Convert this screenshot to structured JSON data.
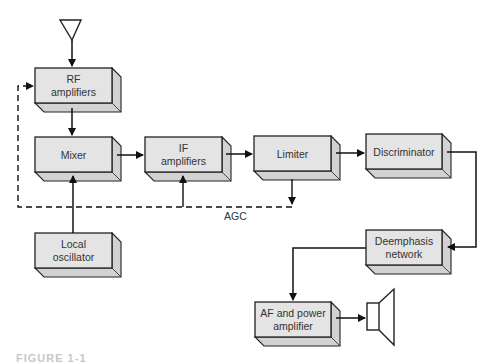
{
  "diagram": {
    "type": "block-diagram",
    "colors": {
      "box_face": "#e4e4e4",
      "box_side": "#d2d2d2",
      "stroke": "#222222",
      "text": "#333333"
    },
    "blocks": [
      {
        "id": "rf",
        "lines": [
          "RF",
          "amplifiers"
        ],
        "x": 35,
        "y": 68,
        "w": 77,
        "h": 35
      },
      {
        "id": "mixer",
        "lines": [
          "Mixer"
        ],
        "x": 35,
        "y": 137,
        "w": 77,
        "h": 35
      },
      {
        "id": "if",
        "lines": [
          "IF",
          "amplifiers"
        ],
        "x": 145,
        "y": 137,
        "w": 77,
        "h": 35
      },
      {
        "id": "lim",
        "lines": [
          "Limiter"
        ],
        "x": 254,
        "y": 136,
        "w": 77,
        "h": 35
      },
      {
        "id": "disc",
        "lines": [
          "Discriminator"
        ],
        "x": 366,
        "y": 134,
        "w": 76,
        "h": 35
      },
      {
        "id": "lo",
        "lines": [
          "Local",
          "oscillator"
        ],
        "x": 35,
        "y": 233,
        "w": 77,
        "h": 35
      },
      {
        "id": "deemp",
        "lines": [
          "Deemphasis",
          "network"
        ],
        "x": 366,
        "y": 230,
        "w": 76,
        "h": 35
      },
      {
        "id": "af",
        "lines": [
          "AF and power",
          "amplifier"
        ],
        "x": 255,
        "y": 302,
        "w": 76,
        "h": 35
      }
    ],
    "agc_label": "AGC",
    "antenna": "antenna-icon",
    "speaker": "speaker-icon"
  },
  "caption": "FIGURE 1-1"
}
